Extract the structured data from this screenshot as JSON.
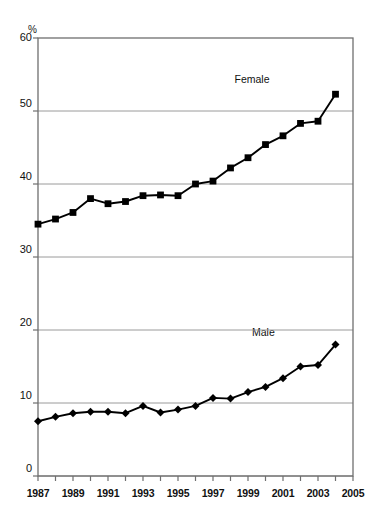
{
  "chart_data": {
    "type": "line",
    "title": "",
    "subtitle": "",
    "xlabel": "",
    "ylabel": "%",
    "yunit_label": "%",
    "x": [
      1987,
      1988,
      1989,
      1990,
      1991,
      1992,
      1993,
      1994,
      1995,
      1996,
      1997,
      1998,
      1999,
      2000,
      2001,
      2002,
      2003,
      2004
    ],
    "xlim": [
      1987,
      2005
    ],
    "ylim": [
      0,
      60
    ],
    "yticks": [
      0,
      10,
      20,
      30,
      40,
      50,
      60
    ],
    "xticks": [
      1987,
      1988,
      1989,
      1990,
      1991,
      1992,
      1993,
      1994,
      1995,
      1996,
      1997,
      1998,
      1999,
      2000,
      2001,
      2002,
      2003,
      2004,
      2005
    ],
    "xtick_labels_shown": [
      "1987",
      "1989",
      "1991",
      "1993",
      "1995",
      "1997",
      "1999",
      "2001",
      "2003",
      "2005"
    ],
    "grid": "horizontal",
    "legend_position": "inline-annotation",
    "series": [
      {
        "name": "Female",
        "marker": "square",
        "color": "#000000",
        "label_x": 1999.6,
        "label_y": 54.2,
        "values": [
          34.5,
          35.2,
          36.1,
          38.0,
          37.3,
          37.6,
          38.4,
          38.5,
          38.4,
          40.0,
          40.4,
          42.2,
          43.6,
          45.4,
          46.6,
          48.3,
          48.6,
          52.3
        ]
      },
      {
        "name": "Male",
        "marker": "diamond",
        "color": "#000000",
        "label_x": 2000.6,
        "label_y": 19.6,
        "values": [
          7.5,
          8.1,
          8.6,
          8.8,
          8.8,
          8.6,
          9.6,
          8.7,
          9.1,
          9.6,
          10.7,
          10.6,
          11.5,
          12.2,
          13.4,
          15.0,
          15.2,
          18.0
        ]
      }
    ]
  },
  "axis": {
    "unit": "%",
    "y_tick_labels": [
      "60",
      "50",
      "40",
      "30",
      "20",
      "10",
      "0"
    ],
    "x_tick_labels": [
      "1987",
      "1989",
      "1991",
      "1993",
      "1995",
      "1997",
      "1999",
      "2001",
      "2003",
      "2005"
    ]
  },
  "annotations": {
    "female": "Female",
    "male": "Male"
  },
  "colors": {
    "line": "#000000",
    "grid": "#9a9a9a",
    "frame": "#6f6f6f",
    "background": "#ffffff"
  }
}
